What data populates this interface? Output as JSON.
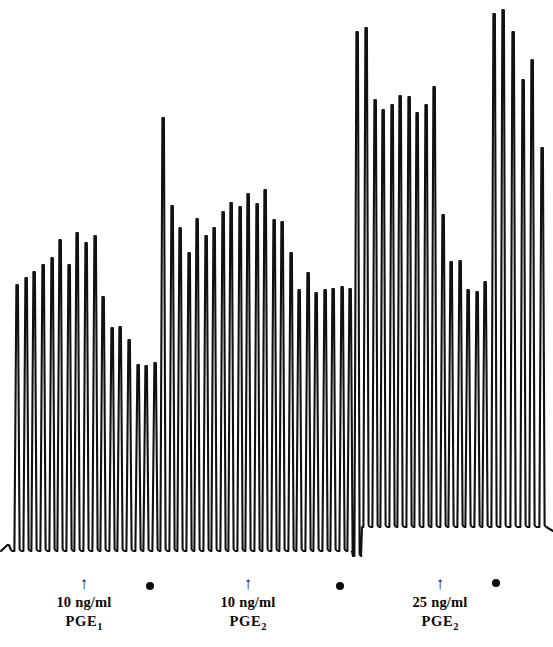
{
  "figure": {
    "kind": "physiograph-recording",
    "background_color": "#ffffff",
    "trace_color": "#111111",
    "width": 553,
    "height": 647,
    "baseline_left_y": 551,
    "baseline_right_y": 527,
    "baseline_shift_x": 358
  },
  "events": [
    {
      "id": "event-1",
      "arrow": "↑",
      "dose": "10 ng/ml",
      "drug": "PGE",
      "drug_subscript": "1",
      "arrow_x": 84,
      "label_x": 84,
      "label_y": 577
    },
    {
      "id": "event-2",
      "arrow": "↑",
      "dose": "10 ng/ml",
      "drug": "PGE",
      "drug_subscript": "2",
      "arrow_x": 248,
      "label_x": 248,
      "label_y": 577
    },
    {
      "id": "event-3",
      "arrow": "↑",
      "dose": "25 ng/ml",
      "drug": "PGE",
      "drug_subscript": "2",
      "arrow_x": 440,
      "label_x": 440,
      "label_y": 577
    }
  ],
  "wash_markers": [
    {
      "id": "wash-1",
      "label": "wash-dot",
      "x": 150,
      "y": 586
    },
    {
      "id": "wash-2",
      "label": "wash-dot",
      "x": 340,
      "y": 586
    },
    {
      "id": "wash-3",
      "label": "wash-dot",
      "x": 496,
      "y": 583
    }
  ],
  "chart_data": {
    "type": "line",
    "title": "",
    "xlabel": "",
    "ylabel": "",
    "grid": false,
    "legend": "none",
    "axis_direction": "y-inverted-screen-coords",
    "baseline_y": 551,
    "spike_spacing_px": 8.6,
    "spike_first_x": 8,
    "spikes": [
      {
        "x": 8,
        "top": 545,
        "base": 551
      },
      {
        "x": 17,
        "top": 285,
        "base": 551
      },
      {
        "x": 26,
        "top": 278,
        "base": 551
      },
      {
        "x": 34,
        "top": 272,
        "base": 551
      },
      {
        "x": 43,
        "top": 265,
        "base": 551
      },
      {
        "x": 52,
        "top": 258,
        "base": 551
      },
      {
        "x": 60,
        "top": 240,
        "base": 551
      },
      {
        "x": 69,
        "top": 265,
        "base": 551
      },
      {
        "x": 77,
        "top": 233,
        "base": 551
      },
      {
        "x": 86,
        "top": 243,
        "base": 551
      },
      {
        "x": 95,
        "top": 236,
        "base": 551
      },
      {
        "x": 103,
        "top": 297,
        "base": 551
      },
      {
        "x": 112,
        "top": 328,
        "base": 551
      },
      {
        "x": 120,
        "top": 327,
        "base": 551
      },
      {
        "x": 129,
        "top": 340,
        "base": 551
      },
      {
        "x": 138,
        "top": 365,
        "base": 551
      },
      {
        "x": 146,
        "top": 366,
        "base": 551
      },
      {
        "x": 155,
        "top": 363,
        "base": 551
      },
      {
        "x": 163,
        "top": 118,
        "base": 551
      },
      {
        "x": 172,
        "top": 206,
        "base": 551
      },
      {
        "x": 180,
        "top": 228,
        "base": 551
      },
      {
        "x": 189,
        "top": 253,
        "base": 551
      },
      {
        "x": 197,
        "top": 219,
        "base": 551
      },
      {
        "x": 206,
        "top": 236,
        "base": 551
      },
      {
        "x": 214,
        "top": 228,
        "base": 551
      },
      {
        "x": 223,
        "top": 212,
        "base": 551
      },
      {
        "x": 231,
        "top": 203,
        "base": 551
      },
      {
        "x": 240,
        "top": 207,
        "base": 551
      },
      {
        "x": 248,
        "top": 194,
        "base": 551
      },
      {
        "x": 257,
        "top": 204,
        "base": 551
      },
      {
        "x": 265,
        "top": 190,
        "base": 551
      },
      {
        "x": 274,
        "top": 220,
        "base": 551
      },
      {
        "x": 282,
        "top": 222,
        "base": 551
      },
      {
        "x": 291,
        "top": 253,
        "base": 551
      },
      {
        "x": 299,
        "top": 290,
        "base": 551
      },
      {
        "x": 308,
        "top": 273,
        "base": 551
      },
      {
        "x": 316,
        "top": 293,
        "base": 551
      },
      {
        "x": 325,
        "top": 290,
        "base": 551
      },
      {
        "x": 333,
        "top": 289,
        "base": 551
      },
      {
        "x": 342,
        "top": 287,
        "base": 551
      },
      {
        "x": 350,
        "top": 289,
        "base": 551
      },
      {
        "x": 357,
        "top": 32,
        "base": 556
      },
      {
        "x": 366,
        "top": 28,
        "base": 527
      },
      {
        "x": 375,
        "top": 100,
        "base": 527
      },
      {
        "x": 383,
        "top": 110,
        "base": 527
      },
      {
        "x": 392,
        "top": 105,
        "base": 527
      },
      {
        "x": 400,
        "top": 96,
        "base": 527
      },
      {
        "x": 409,
        "top": 97,
        "base": 527
      },
      {
        "x": 417,
        "top": 113,
        "base": 527
      },
      {
        "x": 426,
        "top": 105,
        "base": 527
      },
      {
        "x": 434,
        "top": 87,
        "base": 527
      },
      {
        "x": 443,
        "top": 215,
        "base": 527
      },
      {
        "x": 451,
        "top": 262,
        "base": 527
      },
      {
        "x": 460,
        "top": 261,
        "base": 527
      },
      {
        "x": 468,
        "top": 290,
        "base": 527
      },
      {
        "x": 477,
        "top": 292,
        "base": 527
      },
      {
        "x": 485,
        "top": 282,
        "base": 527
      },
      {
        "x": 494,
        "top": 14,
        "base": 527
      },
      {
        "x": 503,
        "top": 10,
        "base": 527
      },
      {
        "x": 513,
        "top": 32,
        "base": 527
      },
      {
        "x": 523,
        "top": 80,
        "base": 527
      },
      {
        "x": 532,
        "top": 60,
        "base": 527
      },
      {
        "x": 542,
        "top": 148,
        "base": 527
      }
    ]
  }
}
